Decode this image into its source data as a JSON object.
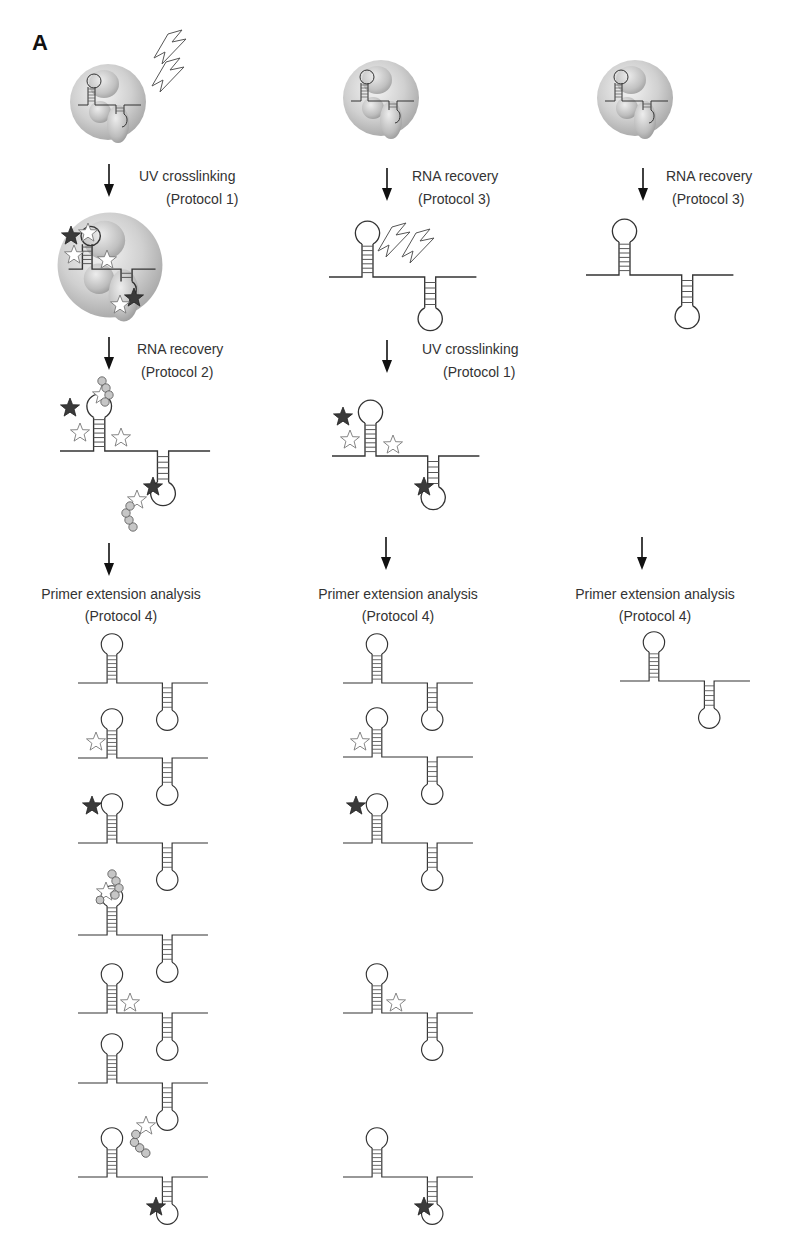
{
  "figure": {
    "panel_label": "A",
    "colors": {
      "line": "#333333",
      "protein_sphere": "#d4d4d4",
      "protein_subunit": "#bdbdbd",
      "dark_star": "#3a3a3a",
      "light_star": "#ffffff",
      "bead": "#c4c4c4"
    },
    "columns": [
      {
        "id": "col1",
        "steps": [
          {
            "icon": "ribonucleoprotein-complex-icon",
            "uv": true
          },
          {
            "title": "UV crosslinking",
            "protocol": "(Protocol 1)"
          },
          {
            "icon": "crosslinked-complex-icon"
          },
          {
            "title": "RNA recovery",
            "protocol": "(Protocol 2)"
          },
          {
            "icon": "rna-with-crosslinks-and-peptides-icon"
          }
        ],
        "analysis": {
          "title": "Primer extension analysis",
          "protocol": "(Protocol 4)"
        },
        "products": [
          "unmodified",
          "light-star-5prime-stem",
          "dark-star-5prime-loop",
          "peptide-5prime-loop",
          "light-star-linker",
          "peptide-3prime-loop",
          "dark-star-3prime-loop"
        ]
      },
      {
        "id": "col2",
        "steps": [
          {
            "icon": "ribonucleoprotein-complex-icon"
          },
          {
            "title": "RNA recovery",
            "protocol": "(Protocol 3)"
          },
          {
            "icon": "naked-rna-uv-icon",
            "uv": true
          },
          {
            "title": "UV crosslinking",
            "protocol": "(Protocol 1)"
          },
          {
            "icon": "rna-with-crosslinks-icon"
          }
        ],
        "analysis": {
          "title": "Primer extension analysis",
          "protocol": "(Protocol 4)"
        },
        "products": [
          "unmodified",
          "light-star-5prime-stem",
          "dark-star-5prime-loop",
          "light-star-linker",
          "dark-star-3prime-loop"
        ]
      },
      {
        "id": "col3",
        "steps": [
          {
            "icon": "ribonucleoprotein-complex-icon"
          },
          {
            "title": "RNA recovery",
            "protocol": "(Protocol 3)"
          },
          {
            "icon": "naked-rna-icon"
          }
        ],
        "analysis": {
          "title": "Primer extension analysis",
          "protocol": "(Protocol 4)"
        },
        "products": [
          "unmodified"
        ]
      }
    ]
  }
}
